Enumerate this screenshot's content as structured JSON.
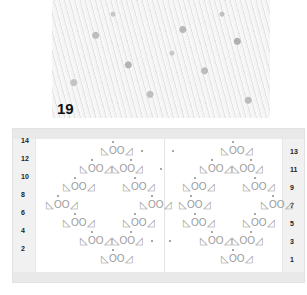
{
  "photo": {
    "swatch_number": "19",
    "description": "knitted lace swatch photo"
  },
  "chart": {
    "left_labels": [
      "14",
      "12",
      "10",
      "8",
      "6",
      "4",
      "2"
    ],
    "right_labels": [
      "13",
      "11",
      "9",
      "7",
      "5",
      "3",
      "1"
    ],
    "motif": "◺OO◿",
    "double_motif": "◺OO◿◺OO◿",
    "legend": {
      "left_triangle": "ssk / left-leaning decrease",
      "circle": "yarn over",
      "right_triangle": "k2tog / right-leaning decrease",
      "dot": "purl"
    },
    "rows": [
      {
        "row": "13",
        "motifs": [
          {
            "x": 88,
            "text": "◺OO◿"
          },
          {
            "x": 208,
            "text": "◺OO◿"
          }
        ],
        "dots": [
          144,
          175
        ]
      },
      {
        "row": "11",
        "motifs": [
          {
            "x": 67,
            "text": "◺OO◿◺OO◿"
          },
          {
            "x": 187,
            "text": "◺OO◿◺OO◿"
          }
        ],
        "dots": [
          159
        ]
      },
      {
        "row": "9",
        "motifs": [
          {
            "x": 50,
            "text": "◺OO◿"
          },
          {
            "x": 110,
            "text": "◺OO◿"
          },
          {
            "x": 170,
            "text": "◺OO◿"
          },
          {
            "x": 230,
            "text": "◺OO◿"
          }
        ],
        "dots": []
      },
      {
        "row": "7",
        "motifs": [
          {
            "x": 33,
            "text": "◺OO◿"
          },
          {
            "x": 127,
            "text": "◺OO◿"
          },
          {
            "x": 166,
            "text": "◺OO◿"
          },
          {
            "x": 248,
            "text": "◺OO◿"
          }
        ],
        "dots": []
      },
      {
        "row": "5",
        "motifs": [
          {
            "x": 50,
            "text": "◺OO◿"
          },
          {
            "x": 110,
            "text": "◺OO◿"
          },
          {
            "x": 170,
            "text": "◺OO◿"
          },
          {
            "x": 230,
            "text": "◺OO◿"
          }
        ],
        "dots": []
      },
      {
        "row": "3",
        "motifs": [
          {
            "x": 67,
            "text": "◺OO◿◺OO◿"
          },
          {
            "x": 187,
            "text": "◺OO◿◺OO◿"
          }
        ],
        "dots": [
          150,
          168
        ]
      },
      {
        "row": "1",
        "motifs": [
          {
            "x": 88,
            "text": "◺OO◿"
          },
          {
            "x": 208,
            "text": "◺OO◿"
          }
        ],
        "dots": []
      }
    ]
  }
}
